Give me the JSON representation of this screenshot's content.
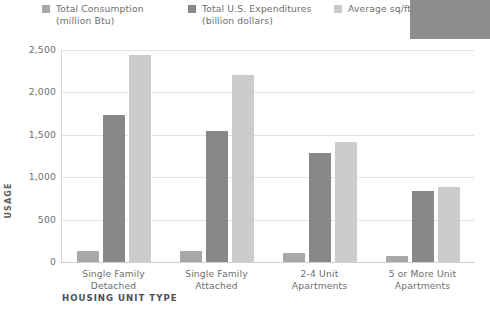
{
  "chart_data": {
    "type": "bar",
    "title": "",
    "xlabel": "HOUSING UNIT TYPE",
    "ylabel": "USAGE",
    "categories": [
      "Single Family\nDetached",
      "Single Family\nAttached",
      "2-4 Unit\nApartments",
      "5 or More Unit\nApartments"
    ],
    "series": [
      {
        "name": "Total Consumption\n(million Btu)",
        "color": "#a8a8a8",
        "values": [
          130,
          135,
          105,
          75
        ]
      },
      {
        "name": "Total U.S. Expenditures\n(billion dollars)",
        "color": "#888888",
        "values": [
          1730,
          1550,
          1280,
          840
        ]
      },
      {
        "name": "Average sq/ft",
        "color": "#cccccc",
        "values": [
          2440,
          2210,
          1420,
          880
        ]
      }
    ],
    "ylim": [
      0,
      2500
    ],
    "ytick_values": [
      0,
      500,
      1000,
      1500,
      2000,
      2500
    ],
    "ytick_labels": [
      "0",
      "500",
      "1,000",
      "1,500",
      "2,000",
      "2,500"
    ],
    "grid": true,
    "legend_position": "top"
  },
  "legend": {
    "items": [
      {
        "label": "Total Consumption\n(million Btu)",
        "color": "#a8a8a8"
      },
      {
        "label": "Total U.S. Expenditures\n(billion dollars)",
        "color": "#888888"
      },
      {
        "label": "Average sq/ft",
        "color": "#cccccc"
      }
    ]
  },
  "occluder": {
    "color": "#8d8d8d"
  }
}
